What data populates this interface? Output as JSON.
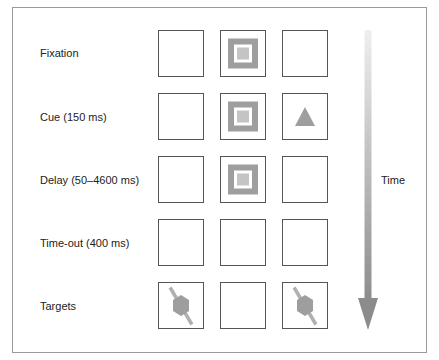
{
  "diagram": {
    "rows": [
      {
        "label": "Fixation",
        "cells": [
          "empty",
          "fixation-square",
          "empty"
        ]
      },
      {
        "label": "Cue (150 ms)",
        "cells": [
          "empty",
          "fixation-square",
          "triangle"
        ]
      },
      {
        "label": "Delay (50–4600 ms)",
        "cells": [
          "empty",
          "fixation-square",
          "empty"
        ]
      },
      {
        "label": "Time-out (400 ms)",
        "cells": [
          "empty",
          "empty",
          "empty"
        ]
      },
      {
        "label": "Targets",
        "cells": [
          "hexagon-target",
          "empty",
          "hexagon-target"
        ]
      }
    ],
    "time_axis": {
      "label": "Time",
      "direction": "down"
    },
    "colors": {
      "stimulus_gray": "#9e9e9e",
      "inner_gray": "#c4c4c4",
      "box_border": "#555555",
      "frame_border": "#9a9a9a",
      "arrow_top": "#efefef",
      "arrow_bottom": "#8c8c8c"
    }
  }
}
